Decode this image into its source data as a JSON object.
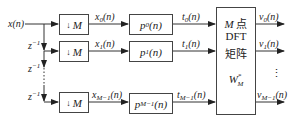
{
  "diagram": {
    "input": {
      "label": "x(n)"
    },
    "delays": [
      {
        "label": "z",
        "exp": "−1"
      },
      {
        "label": "z",
        "exp": "−1"
      },
      {
        "label": "z",
        "exp": "−1"
      }
    ],
    "branches": [
      {
        "decimator": "M",
        "down_symbol": "↓",
        "x_signal": "x",
        "x_sub": "0",
        "filter": "p",
        "filter_sub": "0",
        "t_signal": "t",
        "t_sub": "0",
        "output": "v",
        "output_sub": "0"
      },
      {
        "decimator": "M",
        "down_symbol": "↓",
        "x_signal": "x",
        "x_sub": "1",
        "filter": "p",
        "filter_sub": "1",
        "t_signal": "t",
        "t_sub": "1",
        "output": "v",
        "output_sub": "1"
      },
      {
        "decimator": "M",
        "down_symbol": "↓",
        "x_signal": "x",
        "x_sub": "M−1",
        "filter": "p",
        "filter_sub": "M−1",
        "t_signal": "t",
        "t_sub": "M−1",
        "output": "v",
        "output_sub": "M−1"
      }
    ],
    "arg": "(n)",
    "dft_block": {
      "line1_italic": "M",
      "line1_rest": " 点",
      "line2": "DFT",
      "line3": "矩阵",
      "matrix": "W",
      "matrix_sub": "M",
      "matrix_sup": "*"
    },
    "ellipsis": "⋮"
  }
}
